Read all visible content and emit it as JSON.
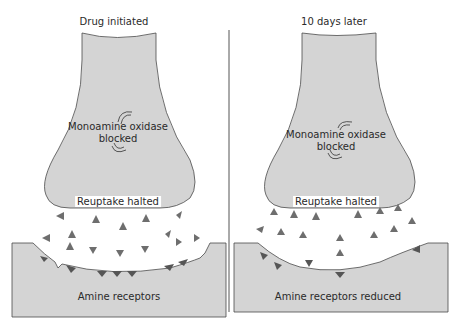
{
  "panels": [
    {
      "title": "Drug initiated",
      "enzyme_label": "Monoamine oxidase",
      "enzyme_state": "blocked",
      "reuptake_label": "Reuptake halted",
      "receptor_label": "Amine receptors"
    },
    {
      "title": "10 days later",
      "enzyme_label": "Monoamine oxidase",
      "enzyme_state": "blocked",
      "reuptake_label": "Reuptake halted",
      "receptor_label": "Amine receptors reduced"
    }
  ],
  "colors": {
    "neuron_fill": "#d4d4d4",
    "outline": "#4a4a4a",
    "molecule": "#6e6e6e",
    "receptor": "#555555"
  }
}
